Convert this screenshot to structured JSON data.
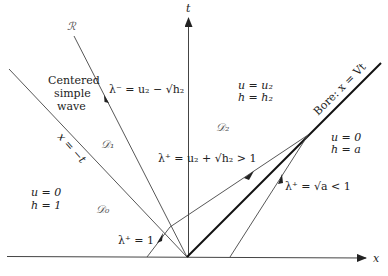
{
  "axes": {
    "x_label": "x",
    "t_label": "t"
  },
  "lines": {
    "rarefaction_label": "ℛ",
    "left_edge_label": "x = −t",
    "bore_label": "Bore:  x = Vt"
  },
  "annotations": {
    "centered_simple_wave": [
      "Centered",
      "simple",
      "wave"
    ],
    "lambda_minus": "λ⁻ = u₂ − √h₂",
    "lambda_plus_middle": "λ⁺ = u₂ + √h₂ > 1",
    "lambda_plus_right": "λ⁺ = √a < 1",
    "lambda_plus_left": "λ⁺ = 1"
  },
  "regions": {
    "D0": {
      "name": "𝒟₀",
      "u": "u = 0",
      "h": "h = 1"
    },
    "D1": {
      "name": "𝒟₁"
    },
    "D2": {
      "name": "𝒟₂",
      "u": "u = u₂",
      "h": "h = h₂"
    },
    "right": {
      "u": "u = 0",
      "h": "h = a"
    }
  },
  "colors": {
    "line": "#333333",
    "bore": "#111111"
  }
}
